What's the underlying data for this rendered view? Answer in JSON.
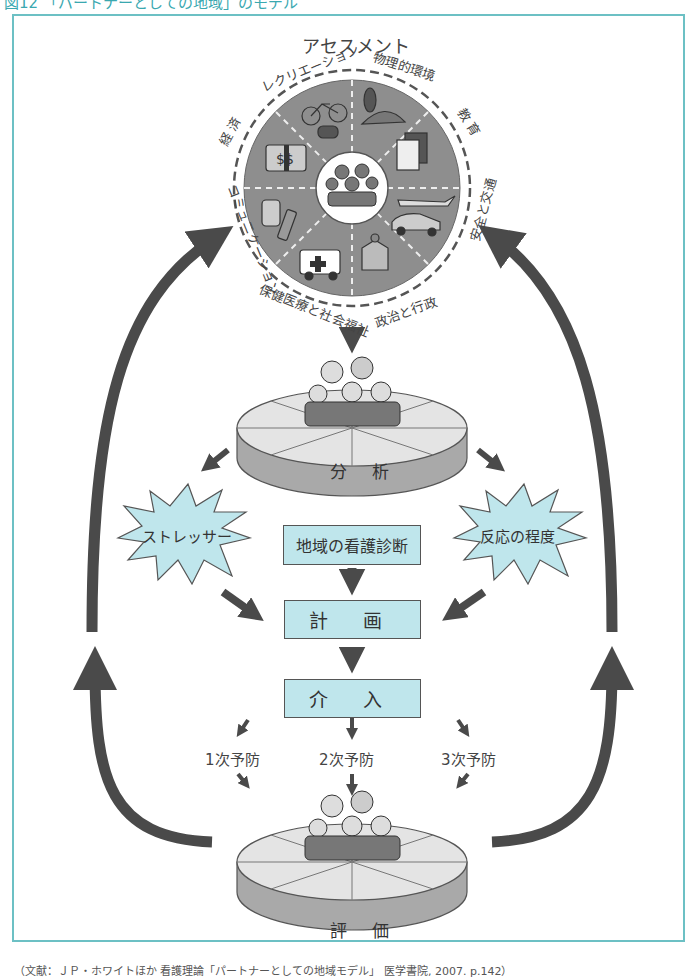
{
  "figure": {
    "title": "図12 「パートナーとしての地域」のモデル",
    "footer": "（文献：ＪＰ・ホワイトほか 看護理論「パートナーとしての地域モデル」 医学書院, 2007. p.142）",
    "colors": {
      "frame": "#6cc0c4",
      "box_fill": "#bfe6ec",
      "arrow": "#4a4a4a",
      "wheel": "#8e8e8e",
      "title": "#3aa8b0"
    }
  },
  "assessment": {
    "label": "アセスメント",
    "subsystems": [
      {
        "label": "レクリエーション",
        "icon": "bicycle-icon"
      },
      {
        "label": "物理的環境",
        "icon": "tree-landscape-icon"
      },
      {
        "label": "教 育",
        "icon": "notebook-icon"
      },
      {
        "label": "安全と交通",
        "icon": "car-airplane-icon"
      },
      {
        "label": "政治と行政",
        "icon": "government-building-icon"
      },
      {
        "label": "保健医療と社会福祉",
        "icon": "ambulance-icon"
      },
      {
        "label": "コミュニケーション",
        "icon": "telephone-icon"
      },
      {
        "label": "経 済",
        "icon": "money-icon"
      }
    ],
    "core": "地域住民（家族）"
  },
  "analysis": {
    "label": "分 析"
  },
  "stressor": {
    "label": "ストレッサー"
  },
  "reaction": {
    "label": "反応の程度"
  },
  "diagnosis": {
    "label": "地域の看護診断"
  },
  "plan": {
    "label": "計 画"
  },
  "intervention": {
    "label": "介 入"
  },
  "prevention": [
    {
      "label": "1次予防"
    },
    {
      "label": "2次予防"
    },
    {
      "label": "3次予防"
    }
  ],
  "evaluation": {
    "label": "評 価"
  }
}
